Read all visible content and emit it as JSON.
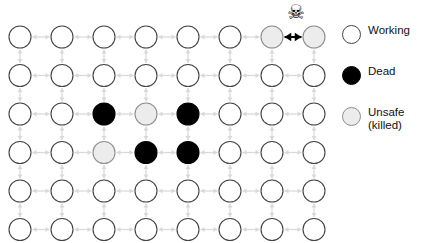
{
  "figure": {
    "type": "mesh-network-diagram",
    "grid": {
      "columns": 8,
      "rows": 6,
      "node_radius": 11,
      "col_spacing": 42,
      "row_spacing": 38.5,
      "origin_x": 20,
      "origin_y": 37
    },
    "states": {
      "working": "#ffffff",
      "dead": "#000000",
      "unsafe": "#ececec",
      "node_stroke": "#444444",
      "unsafe_stroke": "#8e8e8e",
      "link": "#d9d9d9",
      "highlight_link": "#000000"
    },
    "node_states": [
      [
        "working",
        "working",
        "working",
        "working",
        "working",
        "working",
        "unsafe",
        "unsafe"
      ],
      [
        "working",
        "working",
        "working",
        "working",
        "working",
        "working",
        "working",
        "working"
      ],
      [
        "working",
        "working",
        "dead",
        "unsafe",
        "dead",
        "working",
        "working",
        "working"
      ],
      [
        "working",
        "working",
        "unsafe",
        "dead",
        "dead",
        "working",
        "working",
        "working"
      ],
      [
        "working",
        "working",
        "working",
        "working",
        "working",
        "working",
        "working",
        "working"
      ],
      [
        "working",
        "working",
        "working",
        "working",
        "working",
        "working",
        "working",
        "working"
      ]
    ],
    "highlight_link": {
      "row": 0,
      "from_col": 6,
      "to_col": 7,
      "marker": "skull-and-crossbones",
      "glyph": "☠"
    }
  },
  "legend": {
    "items": [
      {
        "label": "Working",
        "state": "working"
      },
      {
        "label": "Dead",
        "state": "dead"
      },
      {
        "label": "Unsafe\n(killed)",
        "state": "unsafe"
      }
    ]
  },
  "credit": {
    "text": "Azimi et al., “Integration Challenges and Tradeoffs for Tera-scale Architectures,” Intel Technology Journal, Vol. 11, Issue 03, August 2007. Reprinted with permission of Intel Corporation."
  }
}
